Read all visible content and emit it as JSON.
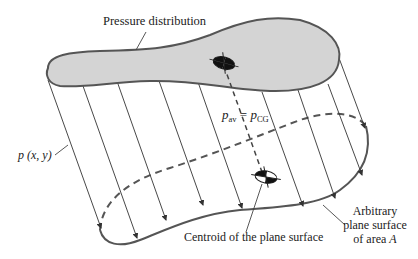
{
  "diagram": {
    "type": "engineering-schematic",
    "labels": {
      "pressure_distribution": "Pressure distribution",
      "pressure_function": "p (x, y)",
      "p_av": "p",
      "p_av_sub": "av",
      "equals": " = ",
      "p_cg": "p",
      "p_cg_sub": "CG",
      "centroid": "Centroid of the plane surface",
      "surface_line1": "Arbitrary",
      "surface_line2": "plane surface",
      "surface_line3_prefix": "of area ",
      "surface_line3_var": "A"
    },
    "colors": {
      "pressure_fill": "#d4d4d4",
      "outline": "#555555",
      "arrow": "#333333",
      "symbol": "#111111"
    },
    "pressure_arrow_count": 9
  }
}
